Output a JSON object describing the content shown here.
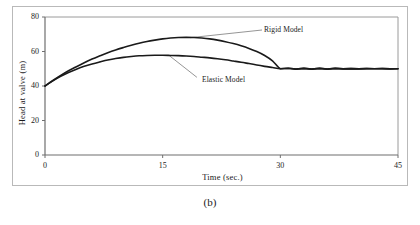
{
  "figure": {
    "caption": "(b)"
  },
  "chart_data": {
    "type": "line",
    "title": "",
    "xlabel": "Time (sec.)",
    "ylabel": "Head at valve (m)",
    "xlim": [
      0,
      45
    ],
    "ylim": [
      0,
      80
    ],
    "xticks": [
      0,
      15,
      30,
      45
    ],
    "yticks": [
      0,
      20,
      40,
      60,
      80
    ],
    "xtick_labels": [
      "0",
      "15",
      "30",
      "45"
    ],
    "ytick_labels": [
      "0",
      "20",
      "40",
      "60",
      "80"
    ],
    "grid": false,
    "legend_position": "inline-annotations",
    "series": [
      {
        "name": "Rigid Model",
        "color": "#1a1a1a",
        "annotation": "Rigid Model",
        "x": [
          0,
          1,
          2,
          3,
          4,
          5,
          6,
          7,
          8,
          9,
          10,
          11,
          12,
          13,
          14,
          15,
          16,
          17,
          18,
          19,
          20,
          21,
          22,
          23,
          24,
          25,
          26,
          27,
          28,
          29,
          30,
          31,
          32,
          33,
          34,
          35,
          36,
          37,
          38,
          39,
          40,
          41,
          42,
          43,
          44,
          45
        ],
        "y": [
          40.0,
          43.2,
          46.1,
          48.8,
          51.2,
          53.5,
          55.6,
          57.5,
          59.3,
          60.9,
          62.3,
          63.6,
          64.8,
          65.8,
          66.6,
          67.3,
          67.8,
          68.1,
          68.2,
          68.1,
          67.8,
          67.3,
          66.6,
          65.7,
          64.6,
          63.3,
          61.8,
          60.0,
          57.7,
          54.6,
          50.0,
          50.3,
          49.8,
          50.2,
          49.8,
          50.2,
          49.8,
          50.2,
          49.9,
          50.1,
          49.9,
          50.1,
          50.0,
          50.1,
          49.9,
          50.0
        ]
      },
      {
        "name": "Elastic Model",
        "color": "#1a1a1a",
        "annotation": "Elastic Model",
        "x": [
          0,
          1,
          2,
          3,
          4,
          5,
          6,
          7,
          8,
          9,
          10,
          11,
          12,
          13,
          14,
          15,
          16,
          17,
          18,
          19,
          20,
          21,
          22,
          23,
          24,
          25,
          26,
          27,
          28,
          29,
          30,
          31,
          32,
          33,
          34,
          35,
          36,
          37,
          38,
          39,
          40,
          41,
          42,
          43,
          44,
          45
        ],
        "y": [
          40.0,
          43.0,
          45.6,
          47.8,
          49.7,
          51.4,
          52.8,
          54.0,
          55.1,
          55.9,
          56.6,
          57.1,
          57.5,
          57.7,
          57.8,
          57.8,
          57.7,
          57.6,
          57.4,
          57.1,
          56.7,
          56.3,
          55.8,
          55.2,
          54.5,
          53.8,
          53.0,
          52.2,
          51.4,
          50.7,
          50.0,
          50.3,
          49.8,
          50.2,
          49.8,
          50.2,
          49.8,
          50.2,
          49.9,
          50.1,
          49.9,
          50.1,
          50.0,
          50.1,
          49.9,
          50.0
        ]
      }
    ],
    "annotations": [
      {
        "text": "Rigid Model",
        "target_x": 18.5,
        "target_y": 68.0
      },
      {
        "text": "Elastic Model",
        "target_x": 15.8,
        "target_y": 57.8
      }
    ]
  }
}
